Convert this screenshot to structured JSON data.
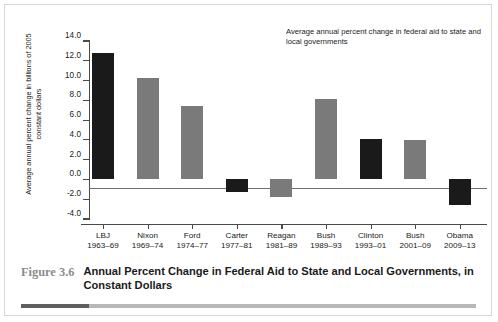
{
  "figure": {
    "number": "Figure 3.6",
    "title": "Annual Percent Change in Federal Aid to State and Local Governments, in Constant Dollars"
  },
  "chart_data": {
    "type": "bar",
    "title": "",
    "annotation": "Average annual percent change in federal aid to state and local governments",
    "ylabel": "Average annual percent change in billions of 2005 constant dollars",
    "xlabel": "",
    "ylim": [
      -4.0,
      14.0
    ],
    "yticks": [
      "14.0",
      "12.0",
      "10.0",
      "8.0",
      "6.0",
      "4.0",
      "2.0",
      "0.0",
      "-2.0",
      "-4.0"
    ],
    "ytick_values": [
      14.0,
      12.0,
      10.0,
      8.0,
      6.0,
      4.0,
      2.0,
      0.0,
      -2.0,
      -4.0
    ],
    "grid": false,
    "legend": "none",
    "categories": [
      "LBJ",
      "Nixon",
      "Ford",
      "Carter",
      "Reagan",
      "Bush",
      "Clinton",
      "Bush",
      "Obama"
    ],
    "category_years": [
      "1963–69",
      "1969–74",
      "1974–77",
      "1977–81",
      "1981–89",
      "1989–93",
      "1993–01",
      "2001–09",
      "2009–13"
    ],
    "values": [
      12.8,
      10.3,
      7.4,
      -1.3,
      -1.8,
      8.1,
      4.1,
      4.0,
      -2.6
    ],
    "bar_colors": [
      "#1a1a1a",
      "#7a7a7a",
      "#7a7a7a",
      "#1a1a1a",
      "#7a7a7a",
      "#7a7a7a",
      "#1a1a1a",
      "#7a7a7a",
      "#1a1a1a"
    ],
    "bars": [
      {
        "label": "LBJ",
        "years": "1963–69",
        "value": 12.8,
        "color": "#1a1a1a"
      },
      {
        "label": "Nixon",
        "years": "1969–74",
        "value": 10.3,
        "color": "#7a7a7a"
      },
      {
        "label": "Ford",
        "years": "1974–77",
        "value": 7.4,
        "color": "#7a7a7a"
      },
      {
        "label": "Carter",
        "years": "1977–81",
        "value": -1.3,
        "color": "#1a1a1a"
      },
      {
        "label": "Reagan",
        "years": "1981–89",
        "value": -1.8,
        "color": "#7a7a7a"
      },
      {
        "label": "Bush",
        "years": "1989–93",
        "value": 8.1,
        "color": "#7a7a7a"
      },
      {
        "label": "Clinton",
        "years": "1993–01",
        "value": 4.1,
        "color": "#1a1a1a"
      },
      {
        "label": "Bush",
        "years": "2001–09",
        "value": 4.0,
        "color": "#7a7a7a"
      },
      {
        "label": "Obama",
        "years": "2009–13",
        "value": -2.6,
        "color": "#1a1a1a"
      }
    ]
  }
}
